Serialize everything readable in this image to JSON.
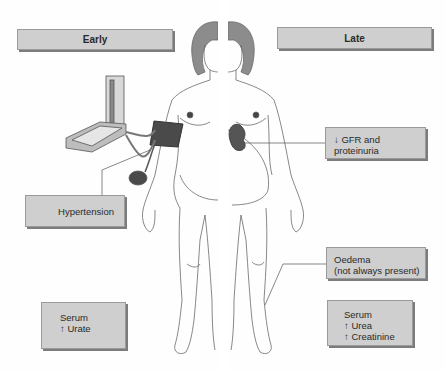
{
  "diagram": {
    "panels": {
      "early": {
        "heading": "Early"
      },
      "late": {
        "heading": "Late"
      }
    },
    "labels": {
      "hypertension": {
        "lines": [
          "Hypertension"
        ]
      },
      "serum_early": {
        "lines": [
          "Serum",
          "↑ Urate"
        ]
      },
      "gfr": {
        "lines": [
          "↓ GFR and",
          "proteinuria"
        ]
      },
      "oedema": {
        "lines": [
          "Oedema",
          "(not always present)"
        ]
      },
      "serum_late": {
        "lines": [
          "Serum",
          "↑ Urea",
          "↑ Creatinine"
        ]
      }
    },
    "illustrations": {
      "left_figure": "pregnant-woman-early-stage",
      "right_figure": "pregnant-woman-late-stage",
      "device": "sphygmomanometer-icon",
      "organ": "kidney-icon"
    },
    "colors": {
      "box_fill": "#cfcfcf",
      "box_shadow": "#7c7c7c",
      "hair": "#8a8a8a",
      "dark_organ": "#555555",
      "line": "#555555"
    }
  }
}
